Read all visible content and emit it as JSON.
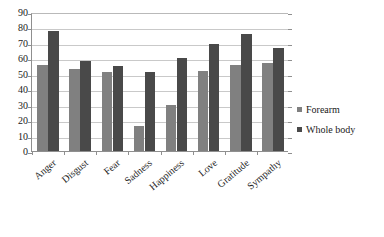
{
  "chart_data": {
    "type": "bar",
    "title": "",
    "subtitle": "",
    "xlabel": "",
    "ylabel": "",
    "ylim": [
      0,
      90
    ],
    "ytick_step": 10,
    "yticks": [
      90,
      80,
      70,
      60,
      50,
      40,
      30,
      20,
      10,
      0
    ],
    "grid": true,
    "legend_position": "right",
    "categories": [
      "Anger",
      "Disgust",
      "Fear",
      "Sadness",
      "Happiness",
      "Love",
      "Gratitude",
      "Sympathy"
    ],
    "series": [
      {
        "name": "Forearm",
        "color": "#808080",
        "values": [
          56,
          53,
          51,
          16,
          30,
          52,
          56,
          57
        ]
      },
      {
        "name": "Whole body",
        "color": "#494949",
        "values": [
          78,
          58,
          55,
          51,
          60,
          69,
          76,
          67
        ]
      }
    ]
  },
  "legend": {
    "items": [
      {
        "label": "Forearm",
        "color": "#808080"
      },
      {
        "label": "Whole body",
        "color": "#494949"
      }
    ]
  },
  "axes": {
    "y_tick_labels": [
      "90",
      "80",
      "70",
      "60",
      "50",
      "40",
      "30",
      "20",
      "10",
      "0"
    ],
    "x_tick_labels": [
      "Anger",
      "Disgust",
      "Fear",
      "Sadness",
      "Happiness",
      "Love",
      "Gratitude",
      "Sympathy"
    ]
  }
}
